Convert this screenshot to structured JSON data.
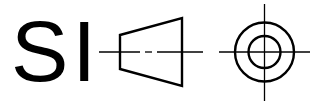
{
  "symbol": {
    "label": "SI",
    "description": "First-angle projection symbol",
    "stroke_color": "#000000",
    "background": "#ffffff"
  }
}
